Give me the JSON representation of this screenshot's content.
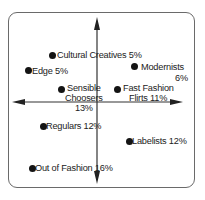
{
  "diagram": {
    "type": "quadrant-segmentation",
    "colors": {
      "frame": "#6a6a6a",
      "axis": "#333333",
      "dot": "#141414",
      "text": "#222222"
    },
    "axes": {
      "vertical": {
        "arrows": "both"
      },
      "horizontal": {
        "arrows": "both"
      }
    },
    "segments": [
      {
        "id": "cultural-creatives",
        "name": "Cultural Creatives",
        "share": "5%",
        "line1": "Cultural Creatives 5%",
        "line2": "",
        "line3": ""
      },
      {
        "id": "edge",
        "name": "Edge",
        "share": "5%",
        "line1": "Edge 5%",
        "line2": "",
        "line3": ""
      },
      {
        "id": "modernists",
        "name": "Modernists",
        "share": "6%",
        "line1": "Modernists",
        "line2": "6%",
        "line3": ""
      },
      {
        "id": "sensible-choosers",
        "name": "Sensible Choosers",
        "share": "13%",
        "line1": "Sensible",
        "line2": "Choosers",
        "line3": "13%"
      },
      {
        "id": "fast-fashion-flirts",
        "name": "Fast Fashion Flirts",
        "share": "11%",
        "line1": "Fast Fashion",
        "line2": "Flirts 11%",
        "line3": ""
      },
      {
        "id": "regulars",
        "name": "Regulars",
        "share": "12%",
        "line1": "Regulars 12%",
        "line2": "",
        "line3": ""
      },
      {
        "id": "labelists",
        "name": "Labelists",
        "share": "12%",
        "line1": "Labelists 12%",
        "line2": "",
        "line3": ""
      },
      {
        "id": "out-of-fashion",
        "name": "Out of Fashion",
        "share": "16%",
        "line1": "Out of Fashion 16%",
        "line2": "",
        "line3": ""
      }
    ]
  }
}
